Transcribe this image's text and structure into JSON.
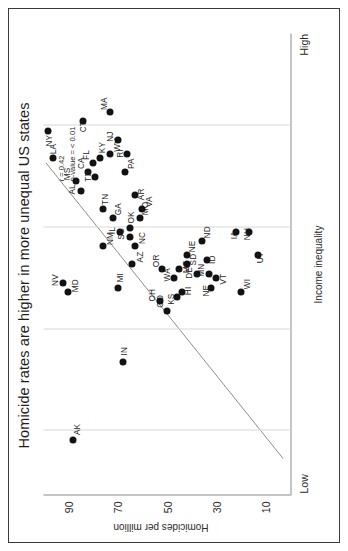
{
  "chart_data": {
    "type": "scatter",
    "title": "Homicide rates are higher in more unequal US states",
    "xlabel": "Income inequality",
    "ylabel": "Homicides per million",
    "x_axis_low_label": "Low",
    "x_axis_high_label": "High",
    "xlim": [
      0,
      100
    ],
    "ylim": [
      0,
      100
    ],
    "yticks": [
      90,
      70,
      50,
      30,
      10
    ],
    "ytick_labels": [
      "90",
      "70",
      "50",
      "30",
      "10"
    ],
    "gridlines_x": [
      14,
      36,
      58,
      80
    ],
    "grid": true,
    "legend": "none",
    "annotations": {
      "r_label": "r = 0.42",
      "p_label": "p-value = < 0.01"
    },
    "trendline": {
      "present": true,
      "x_start": 8,
      "y_start": 3,
      "x_end": 72,
      "y_end": 99
    },
    "point_color": "#121212",
    "gridline_color": "#d8d8d8",
    "axis_color": "#8c8c8c",
    "points": [
      {
        "label": "LA",
        "x": 73,
        "y": 96,
        "lx": 4,
        "ly": -1
      },
      {
        "label": "NY",
        "x": 79,
        "y": 98,
        "lx": -16,
        "ly": 0
      },
      {
        "label": "AK",
        "x": 12,
        "y": 88,
        "lx": 5,
        "ly": 3
      },
      {
        "label": "NV",
        "x": 46,
        "y": 92,
        "lx": -3,
        "ly": -9
      },
      {
        "label": "MD",
        "x": 44,
        "y": 90,
        "lx": 0,
        "ly": 6
      },
      {
        "label": "MI",
        "x": 45,
        "y": 70,
        "lx": 5,
        "ly": 2
      },
      {
        "label": "IN",
        "x": 29,
        "y": 68,
        "lx": 6,
        "ly": 1
      },
      {
        "label": "NM",
        "x": 54,
        "y": 76,
        "lx": 1,
        "ly": 7
      },
      {
        "label": "AZ",
        "x": 50,
        "y": 64,
        "lx": 2,
        "ly": 7
      },
      {
        "label": "IL",
        "x": 57,
        "y": 69,
        "lx": -2,
        "ly": -9
      },
      {
        "label": "SC",
        "x": 56,
        "y": 65,
        "lx": -3,
        "ly": -9
      },
      {
        "label": "NC",
        "x": 54,
        "y": 63,
        "lx": 2,
        "ly": 7
      },
      {
        "label": "OK",
        "x": 58,
        "y": 65,
        "lx": 4,
        "ly": 1
      },
      {
        "label": "GA",
        "x": 60,
        "y": 72,
        "lx": 3,
        "ly": 5
      },
      {
        "label": "TN",
        "x": 62,
        "y": 76,
        "lx": 4,
        "ly": 2
      },
      {
        "label": "MO",
        "x": 60,
        "y": 61,
        "lx": 3,
        "ly": 5
      },
      {
        "label": "VA",
        "x": 62,
        "y": 60,
        "lx": 2,
        "ly": 6
      },
      {
        "label": "AR",
        "x": 65,
        "y": 63,
        "lx": -5,
        "ly": 6
      },
      {
        "label": "AL",
        "x": 66,
        "y": 85,
        "lx": -4,
        "ly": -9
      },
      {
        "label": "MS",
        "x": 68,
        "y": 87,
        "lx": 1,
        "ly": -9
      },
      {
        "label": "CA",
        "x": 70,
        "y": 82,
        "lx": 3,
        "ly": -7
      },
      {
        "label": "TX",
        "x": 69,
        "y": 79,
        "lx": -5,
        "ly": -8
      },
      {
        "label": "FL",
        "x": 72,
        "y": 80,
        "lx": 3,
        "ly": -7
      },
      {
        "label": "KY",
        "x": 73,
        "y": 77,
        "lx": 5,
        "ly": 1
      },
      {
        "label": "WV",
        "x": 74,
        "y": 73,
        "lx": 2,
        "ly": 6
      },
      {
        "label": "PA",
        "x": 70,
        "y": 67,
        "lx": 3,
        "ly": 5
      },
      {
        "label": "RI",
        "x": 74,
        "y": 66,
        "lx": -4,
        "ly": -8
      },
      {
        "label": "NJ",
        "x": 77,
        "y": 70,
        "lx": -2,
        "ly": -8
      },
      {
        "label": "MA",
        "x": 83,
        "y": 73,
        "lx": 2,
        "ly": -7
      },
      {
        "label": "CT",
        "x": 81,
        "y": 84,
        "lx": -11,
        "ly": -1
      },
      {
        "label": "CO",
        "x": 40,
        "y": 50,
        "lx": 3,
        "ly": -8
      },
      {
        "label": "OH",
        "x": 42,
        "y": 53,
        "lx": 0,
        "ly": -8
      },
      {
        "label": "KS",
        "x": 43,
        "y": 46,
        "lx": -8,
        "ly": -6
      },
      {
        "label": "HI",
        "x": 44,
        "y": 44,
        "lx": -3,
        "ly": 6
      },
      {
        "label": "WA",
        "x": 47,
        "y": 47,
        "lx": -3,
        "ly": -8
      },
      {
        "label": "OR",
        "x": 49,
        "y": 52,
        "lx": 2,
        "ly": -7
      },
      {
        "label": "MT",
        "x": 49,
        "y": 45,
        "lx": -4,
        "ly": 6
      },
      {
        "label": "SD",
        "x": 50,
        "y": 42,
        "lx": -1,
        "ly": 6
      },
      {
        "label": "NE",
        "x": 52,
        "y": 42,
        "lx": 3,
        "ly": 5
      },
      {
        "label": "DE",
        "x": 48,
        "y": 38,
        "lx": -5,
        "ly": -8
      },
      {
        "label": "NE2",
        "x": 45,
        "y": 32,
        "lx": -9,
        "ly": -6
      },
      {
        "label": "MN",
        "x": 48,
        "y": 33,
        "lx": -3,
        "ly": -8
      },
      {
        "label": "VT",
        "x": 47,
        "y": 30,
        "lx": -6,
        "ly": 6
      },
      {
        "label": "ID",
        "x": 51,
        "y": 34,
        "lx": -4,
        "ly": 5
      },
      {
        "label": "ND",
        "x": 55,
        "y": 36,
        "lx": 3,
        "ly": 5
      },
      {
        "label": "WI",
        "x": 44,
        "y": 20,
        "lx": 3,
        "ly": 5
      },
      {
        "label": "IA",
        "x": 57,
        "y": 22,
        "lx": -7,
        "ly": -3
      },
      {
        "label": "NH",
        "x": 57,
        "y": 17,
        "lx": -8,
        "ly": -2
      },
      {
        "label": "UT",
        "x": 52,
        "y": 13,
        "lx": -8,
        "ly": 1
      }
    ]
  }
}
